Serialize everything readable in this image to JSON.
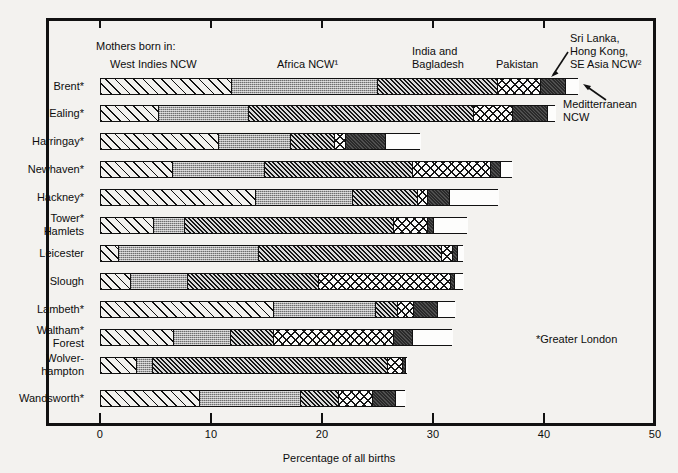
{
  "chart_data": {
    "type": "bar",
    "subtype": "horizontal stacked bar",
    "title": "",
    "xlabel": "Percentage of all births",
    "ylabel": "",
    "xlim": [
      0,
      50
    ],
    "xticks": [
      "0",
      "10",
      "20",
      "30",
      "40",
      "50"
    ],
    "grid": false,
    "legend_position": "top (inline category headings)",
    "legend_intro": "Mothers born in:",
    "series": [
      {
        "name": "West Indies NCW",
        "key": "wi",
        "values": [
          11.8,
          5.2,
          10.6,
          6.5,
          14.0,
          4.8,
          1.6,
          2.7,
          15.6,
          6.6,
          3.2,
          8.9
        ]
      },
      {
        "name": "Africa NCW¹",
        "key": "af",
        "values": [
          25.0,
          13.3,
          17.1,
          14.8,
          22.7,
          7.6,
          14.2,
          7.8,
          24.8,
          11.7,
          4.7,
          18.0
        ]
      },
      {
        "name": "India and Bagladesh",
        "key": "in",
        "values": [
          35.8,
          33.6,
          21.1,
          28.1,
          28.6,
          26.4,
          30.7,
          19.6,
          26.8,
          15.6,
          25.9,
          21.4
        ]
      },
      {
        "name": "Pakistan",
        "key": "pk",
        "values": [
          39.6,
          37.1,
          22.1,
          35.1,
          29.5,
          29.5,
          31.7,
          31.5,
          28.2,
          26.4,
          27.2,
          24.5
        ]
      },
      {
        "name": "Sri Lanka, Hong Kong, SE Asia NCW²",
        "key": "sl",
        "values": [
          41.9,
          40.3,
          25.7,
          36.0,
          31.4,
          30.0,
          32.2,
          31.9,
          30.4,
          28.1,
          27.5,
          26.6
        ]
      },
      {
        "name": "Meditterranean NCW",
        "key": "md",
        "values": [
          43.1,
          41.0,
          28.8,
          37.1,
          35.9,
          33.1,
          32.7,
          32.7,
          32.0,
          31.7,
          27.7,
          27.5
        ]
      }
    ],
    "categories": [
      "Brent*",
      "Ealing*",
      "Harringay*",
      "Newhaven*",
      "Hackney*",
      "Tower* Hamlets",
      "Leicester",
      "Slough",
      "Lambeth*",
      "Waltham* Forest",
      "Wolver-hampton",
      "Wandsworth*"
    ]
  },
  "axis": {
    "x_title": "Percentage of all births",
    "ticks": [
      {
        "label": "0",
        "value": 0
      },
      {
        "label": "10",
        "value": 10
      },
      {
        "label": "20",
        "value": 20
      },
      {
        "label": "30",
        "value": 30
      },
      {
        "label": "40",
        "value": 40
      },
      {
        "label": "50",
        "value": 50
      }
    ]
  },
  "legend": {
    "intro": "Mothers born in:",
    "items": [
      {
        "label": "West Indies NCW"
      },
      {
        "label": "Africa NCW¹"
      },
      {
        "label": "India and"
      },
      {
        "label": "Bagladesh"
      },
      {
        "label": "Pakistan"
      },
      {
        "label": "Sri Lanka,"
      },
      {
        "label": "Hong Kong,"
      },
      {
        "label": "SE Asia NCW²"
      },
      {
        "label": "Meditterranean"
      },
      {
        "label": "NCW"
      }
    ]
  },
  "rows": [
    {
      "label_line1": "Brent*",
      "label_line2": ""
    },
    {
      "label_line1": "Ealing*",
      "label_line2": ""
    },
    {
      "label_line1": "Harringay*",
      "label_line2": ""
    },
    {
      "label_line1": "Newhaven*",
      "label_line2": ""
    },
    {
      "label_line1": "Hackney*",
      "label_line2": ""
    },
    {
      "label_line1": "Tower*",
      "label_line2": "Hamlets"
    },
    {
      "label_line1": "Leicester",
      "label_line2": ""
    },
    {
      "label_line1": "Slough",
      "label_line2": ""
    },
    {
      "label_line1": "Lambeth*",
      "label_line2": ""
    },
    {
      "label_line1": "Waltham*",
      "label_line2": "Forest"
    },
    {
      "label_line1": "Wolver-",
      "label_line2": "hampton"
    },
    {
      "label_line1": "Wandsworth*",
      "label_line2": ""
    }
  ],
  "notes": {
    "greater_london": "*Greater London"
  },
  "colors": {
    "ink": "#111111",
    "background": "#f3f2ef",
    "west_indies": "#f2f1ee",
    "africa": "#a8a8a8",
    "india": "#9a9a9a",
    "pakistan": "#fbfbfa",
    "sri_lanka": "#2a2a2a",
    "mediterranean": "#fdfdfc"
  }
}
